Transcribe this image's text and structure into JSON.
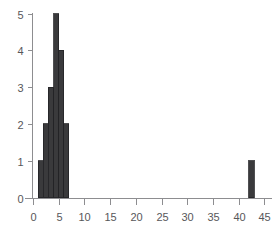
{
  "chart_data": {
    "type": "bar",
    "title": "",
    "subtitle": "",
    "xlabel": "",
    "ylabel": "",
    "grid": false,
    "legend": null,
    "xlim": [
      -1,
      46
    ],
    "ylim": [
      0,
      5
    ],
    "xticks": [
      0,
      5,
      10,
      15,
      20,
      25,
      30,
      35,
      40,
      45
    ],
    "xtick_labels": [
      "0",
      "5",
      "10",
      "15",
      "20",
      "25",
      "30",
      "35",
      "40",
      "45"
    ],
    "yticks": [
      0,
      1,
      2,
      3,
      4,
      5
    ],
    "ytick_labels": [
      "0",
      "1",
      "2",
      "3",
      "4",
      "5"
    ],
    "bin_width": 1,
    "bars": [
      {
        "x_left": 1,
        "x_right": 2,
        "height": 1
      },
      {
        "x_left": 2,
        "x_right": 3,
        "height": 2
      },
      {
        "x_left": 3,
        "x_right": 4,
        "height": 3
      },
      {
        "x_left": 4,
        "x_right": 5,
        "height": 5
      },
      {
        "x_left": 5,
        "x_right": 6,
        "height": 4
      },
      {
        "x_left": 6,
        "x_right": 7,
        "height": 2
      },
      {
        "x_left": 42,
        "x_right": 43,
        "height": 1
      }
    ],
    "categories": [
      "1",
      "2",
      "3",
      "4",
      "5",
      "6",
      "42"
    ],
    "values": [
      1,
      2,
      3,
      5,
      4,
      2,
      1
    ],
    "colors": {
      "bar_fill": "#3a3a3c",
      "bar_edge": "#232325",
      "axis": "#8d8d90",
      "tick_text": "#57575a",
      "background": "#ffffff"
    }
  }
}
